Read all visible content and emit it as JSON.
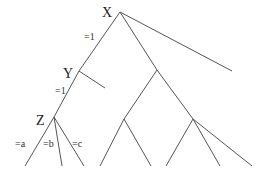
{
  "diagram": {
    "type": "game-tree",
    "nodes": [
      {
        "id": "X",
        "label": "X",
        "x": 120,
        "y": 12,
        "label_x": 102,
        "label_y": 17
      },
      {
        "id": "Y",
        "label": "Y",
        "x": 79,
        "y": 71,
        "label_x": 63,
        "label_y": 78
      },
      {
        "id": "Z",
        "label": "Z",
        "x": 54,
        "y": 117,
        "label_x": 36,
        "label_y": 125
      },
      {
        "id": "M",
        "label": "",
        "x": 157,
        "y": 70
      },
      {
        "id": "L1",
        "label": "",
        "x": 124,
        "y": 119
      },
      {
        "id": "R1",
        "label": "",
        "x": 193,
        "y": 119
      }
    ],
    "edges": [
      {
        "from": [
          120,
          12
        ],
        "to": [
          79,
          71
        ],
        "label": "=1",
        "label_x": 84,
        "label_y": 40
      },
      {
        "from": [
          120,
          12
        ],
        "to": [
          157,
          70
        ],
        "label": ""
      },
      {
        "from": [
          120,
          12
        ],
        "to": [
          232,
          71
        ],
        "label": ""
      },
      {
        "from": [
          79,
          71
        ],
        "to": [
          54,
          117
        ],
        "label": "=1",
        "label_x": 55,
        "label_y": 94
      },
      {
        "from": [
          79,
          71
        ],
        "to": [
          105,
          88
        ],
        "label": ""
      },
      {
        "from": [
          54,
          117
        ],
        "to": [
          25,
          166
        ],
        "label": "=a",
        "label_x": 15,
        "label_y": 147
      },
      {
        "from": [
          54,
          117
        ],
        "to": [
          62,
          166
        ],
        "label": "=b",
        "label_x": 43,
        "label_y": 147
      },
      {
        "from": [
          54,
          117
        ],
        "to": [
          84,
          166
        ],
        "label": "=c",
        "label_x": 72,
        "label_y": 147
      },
      {
        "from": [
          157,
          70
        ],
        "to": [
          124,
          119
        ],
        "label": ""
      },
      {
        "from": [
          157,
          70
        ],
        "to": [
          193,
          119
        ],
        "label": ""
      },
      {
        "from": [
          124,
          119
        ],
        "to": [
          100,
          166
        ],
        "label": ""
      },
      {
        "from": [
          124,
          119
        ],
        "to": [
          151,
          166
        ],
        "label": ""
      },
      {
        "from": [
          193,
          119
        ],
        "to": [
          166,
          166
        ],
        "label": ""
      },
      {
        "from": [
          193,
          119
        ],
        "to": [
          220,
          166
        ],
        "label": ""
      },
      {
        "from": [
          193,
          119
        ],
        "to": [
          252,
          166
        ],
        "label": ""
      }
    ]
  }
}
